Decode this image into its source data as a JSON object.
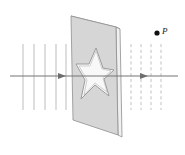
{
  "figure": {
    "background_color": "#ffffff",
    "width": 185,
    "height": 155
  },
  "labels": {
    "point_p": "P"
  },
  "colors": {
    "plate_fill": "#d4d4d4",
    "plate_edge": "#8c8c8c",
    "plate_side_fill": "#efefef",
    "star_fill": "#f7f7f7",
    "star_edge": "#9a9a9a",
    "field_line": "#b9b9b9",
    "axis_line": "#6e6e6e",
    "point_marker": "#111111",
    "label_color": "#1a1a1a"
  },
  "plate": {
    "name": "charged-plane-slab",
    "front_face": "71,16 116,27 118,135 73,120",
    "side_face": "116,27 120,29 122,137 118,135",
    "top_face": "71,16 75,18 120,29 116,27"
  },
  "star": {
    "name": "star-aperture",
    "points": "96,48 103,68 114,70 104,79 109,96 95,85 81,99 85,80 76,64 89,64"
  },
  "field_lines": {
    "left": {
      "style": "solid",
      "count": 5,
      "x_positions": [
        23,
        34,
        45,
        56,
        66
      ],
      "y_top": 44,
      "y_bottom": 110
    },
    "right": {
      "style": "dashed",
      "count": 4,
      "x_positions": [
        131,
        141,
        151,
        161
      ],
      "y_top": 44,
      "y_bottom": 110
    }
  },
  "axis": {
    "name": "horizontal-axis-with-arrows",
    "y": 76,
    "x_start": 10,
    "x_end": 178,
    "arrow_positions": [
      62,
      144
    ]
  },
  "point_p": {
    "name": "point-p-marker",
    "cx": 157,
    "cy": 33,
    "r": 2.6,
    "label_x": 162,
    "label_y": 32
  }
}
